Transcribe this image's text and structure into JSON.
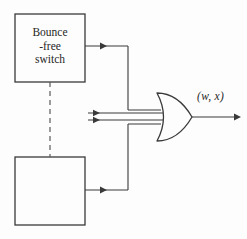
{
  "figure": {
    "type": "logic-circuit-diagram",
    "background_color": "#fdfdfd",
    "line_color": "#3a3a3a",
    "text_color": "#262626"
  },
  "blocks": [
    {
      "name": "bounce-free-switch-top",
      "label": "Bounce\n-free\nswitch",
      "x": 15,
      "y": 14,
      "width": 70,
      "height": 68
    },
    {
      "name": "bounce-free-switch-bottom",
      "label": "",
      "x": 15,
      "y": 157,
      "width": 70,
      "height": 68
    }
  ],
  "connectors": {
    "dashed_link": {
      "name": "mechanical-linkage",
      "from_x": 50,
      "from_y": 82,
      "to_x": 50,
      "to_y": 157
    },
    "top_wire": {
      "name": "top-switch-output-wire",
      "y": 46,
      "from_x": 85,
      "to_x": 128,
      "arrow_x": 104
    },
    "bottom_wire": {
      "name": "bottom-switch-output-wire",
      "y": 190,
      "from_x": 85,
      "to_x": 128,
      "arrow_x": 104
    },
    "bus": {
      "name": "vertical-bus",
      "x": 128,
      "top_y": 46,
      "bottom_y": 190
    },
    "direct_inputs": [
      {
        "name": "gate-input-upper",
        "y": 113,
        "from_x": 88,
        "to_x": 160,
        "arrow_x": 97
      },
      {
        "name": "gate-input-lower",
        "y": 120,
        "from_x": 88,
        "to_x": 160,
        "arrow_x": 97
      }
    ],
    "gate_feed_upper": {
      "name": "bus-to-gate-upper",
      "y": 110,
      "from_x": 128,
      "to_x": 160
    },
    "gate_feed_lower": {
      "name": "bus-to-gate-lower",
      "y": 124,
      "from_x": 128,
      "to_x": 160
    },
    "output_wire": {
      "name": "gate-output-wire",
      "y": 117,
      "from_x": 192,
      "to_x": 240
    }
  },
  "gate": {
    "name": "or-gate",
    "kind": "OR",
    "x": 155,
    "y": 93,
    "width": 38,
    "height": 48
  },
  "labels": {
    "output": "(w, x)"
  }
}
